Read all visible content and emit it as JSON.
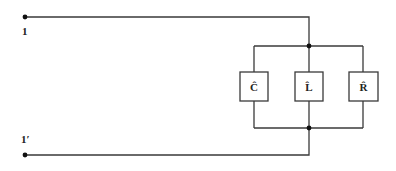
{
  "diagram": {
    "type": "circuit",
    "terminals": [
      {
        "id": "top",
        "label": "1"
      },
      {
        "id": "bottom",
        "label": "1′"
      }
    ],
    "elements": [
      {
        "id": "C",
        "label": "Ĉ",
        "kind": "capacitor"
      },
      {
        "id": "L",
        "label": "L̂",
        "kind": "inductor"
      },
      {
        "id": "R",
        "label": "R̂",
        "kind": "resistor"
      }
    ],
    "topology": "parallel",
    "colors": {
      "wire": "#3a3a3a",
      "node": "#111111",
      "background": "#ffffff"
    }
  }
}
